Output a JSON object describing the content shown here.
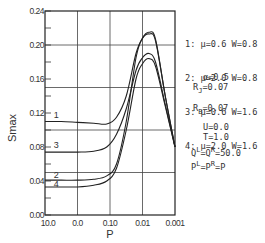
{
  "chart_data": {
    "type": "line",
    "title": "",
    "xlabel": "P",
    "ylabel": "Smax",
    "x_ticks": [
      "10.0",
      "0.0",
      "0.10",
      "0.01",
      "0.001"
    ],
    "y_ticks": [
      "0.00",
      "0.04",
      "0.08",
      "0.12",
      "0.16",
      "0.20",
      "0.24"
    ],
    "y_tick_values": [
      0.0,
      0.04,
      0.08,
      0.12,
      0.16,
      0.2,
      0.24
    ],
    "ylim": [
      0.0,
      0.24
    ],
    "x_scale": "log (decreasing P, tick positions index 0-4)",
    "grid": {
      "horizontal": [
        0.05,
        0.1,
        0.15,
        0.2
      ],
      "vertical_at_ticks": true
    },
    "series": [
      {
        "name": "1",
        "label": "1: μ=0.6 W=0.8",
        "x": [
          0,
          0.5,
          1.0,
          1.5,
          1.9,
          2.2,
          2.5,
          2.8,
          3.0,
          3.2,
          3.4,
          3.7,
          4.0
        ],
        "values": [
          0.11,
          0.11,
          0.109,
          0.108,
          0.107,
          0.115,
          0.14,
          0.19,
          0.208,
          0.213,
          0.205,
          0.14,
          0.08
        ]
      },
      {
        "name": "2",
        "label": "2: μ=2.0 W=0.8",
        "x": [
          0,
          0.5,
          1.0,
          1.5,
          1.9,
          2.2,
          2.5,
          2.8,
          3.0,
          3.2,
          3.4,
          3.7,
          4.0
        ],
        "values": [
          0.041,
          0.041,
          0.041,
          0.042,
          0.046,
          0.06,
          0.11,
          0.185,
          0.208,
          0.215,
          0.207,
          0.14,
          0.08
        ]
      },
      {
        "name": "3",
        "label": "3: μ=0.6 W=1.6",
        "x": [
          0,
          0.5,
          1.0,
          1.5,
          1.9,
          2.2,
          2.5,
          2.8,
          3.0,
          3.2,
          3.4,
          3.7,
          4.0
        ],
        "values": [
          0.074,
          0.074,
          0.074,
          0.075,
          0.08,
          0.095,
          0.125,
          0.17,
          0.185,
          0.19,
          0.18,
          0.13,
          0.08
        ]
      },
      {
        "name": "4",
        "label": "4: μ=2.0 W=1.6",
        "x": [
          0,
          0.5,
          1.0,
          1.5,
          1.9,
          2.2,
          2.5,
          2.8,
          3.0,
          3.2,
          3.4,
          3.7,
          4.0
        ],
        "values": [
          0.033,
          0.033,
          0.033,
          0.035,
          0.04,
          0.055,
          0.1,
          0.16,
          0.178,
          0.184,
          0.175,
          0.128,
          0.08
        ]
      }
    ],
    "curve_labels": [
      {
        "text": "1",
        "x": 0.35,
        "y": 0.118
      },
      {
        "text": "3",
        "x": 0.35,
        "y": 0.082
      },
      {
        "text": "2",
        "x": 0.35,
        "y": 0.047
      },
      {
        "text": "4",
        "x": 0.35,
        "y": 0.036
      }
    ],
    "legend": [
      "1: μ=0.6 W=0.8",
      "2: μ=2.0 W=0.8",
      "3: μ=0.6 W=1.6",
      "4: μ=2.0 W=1.6"
    ],
    "annotations": {
      "alpha": "α=0.5",
      "RJ": "=0.07",
      "RB": "=0.07",
      "U": "U=0.0",
      "T": "T=1.0",
      "Q": "=50.0",
      "P": "=P"
    }
  }
}
